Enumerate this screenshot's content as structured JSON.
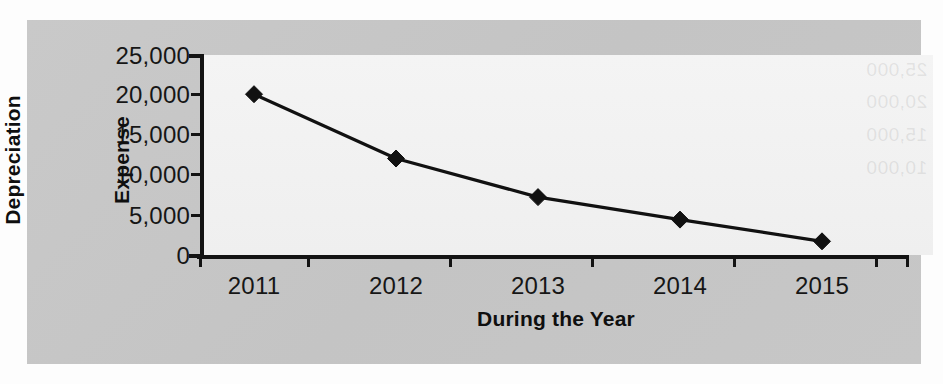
{
  "figure": {
    "background_color": "#c6c6c6",
    "plot_background_color": "#f1f1f1",
    "series_color": "#111111"
  },
  "chart_data": {
    "type": "line",
    "title": "",
    "subtitle": "",
    "categories": [
      "2011",
      "2012",
      "2013",
      "2014",
      "2015"
    ],
    "values": [
      20000,
      12000,
      7200,
      4400,
      1700
    ],
    "series": [
      {
        "name": "Depreciation Expense",
        "values": [
          20000,
          12000,
          7200,
          4400,
          1700
        ]
      }
    ],
    "xlabel": "During the Year",
    "ylabel": "Depreciation Expense",
    "ylabel_lines": [
      "Depreciation",
      "Expense"
    ],
    "ylim": [
      0,
      25000
    ],
    "yticks": [
      0,
      5000,
      10000,
      15000,
      20000,
      25000
    ],
    "ytick_labels": [
      "0",
      "5,000",
      "10,000",
      "15,000",
      "20,000",
      "25,000"
    ],
    "xtick_labels": [
      "2011",
      "2012",
      "2013",
      "2014",
      "2015"
    ],
    "grid": false,
    "legend": false,
    "legend_position": "none",
    "marker": "diamond",
    "line_color": "#111111",
    "marker_color": "#111111"
  },
  "ghost_text": {
    "items": [
      "25,000",
      "20,000",
      "15,000",
      "10,000"
    ]
  }
}
